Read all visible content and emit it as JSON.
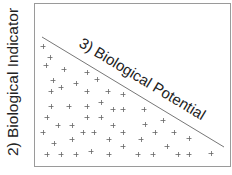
{
  "diagram": {
    "y_axis_label": "2) Biological Indicator",
    "diagonal_label": "3) Biological Potential",
    "colors": {
      "frame": "#9a9a9a",
      "line": "#777777",
      "markers": "#666666",
      "text": "#222222"
    },
    "marker_symbol": "+",
    "frame": {
      "x": 34,
      "y": 3,
      "width": 196,
      "height": 163
    },
    "diagonal": {
      "x1": 42,
      "y1": 37,
      "x2": 224,
      "y2": 147
    },
    "points": [
      [
        43,
        46
      ],
      [
        50,
        57
      ],
      [
        46,
        65
      ],
      [
        64,
        69
      ],
      [
        87,
        72
      ],
      [
        53,
        80
      ],
      [
        76,
        83
      ],
      [
        97,
        79
      ],
      [
        51,
        91
      ],
      [
        61,
        87
      ],
      [
        87,
        91
      ],
      [
        108,
        91
      ],
      [
        123,
        94
      ],
      [
        51,
        106
      ],
      [
        69,
        106
      ],
      [
        87,
        106
      ],
      [
        101,
        102
      ],
      [
        113,
        109
      ],
      [
        123,
        109
      ],
      [
        144,
        109
      ],
      [
        47,
        117
      ],
      [
        87,
        117
      ],
      [
        101,
        117
      ],
      [
        163,
        120
      ],
      [
        58,
        125
      ],
      [
        72,
        125
      ],
      [
        113,
        125
      ],
      [
        145,
        124
      ],
      [
        43,
        132
      ],
      [
        83,
        132
      ],
      [
        94,
        132
      ],
      [
        123,
        132
      ],
      [
        155,
        132
      ],
      [
        174,
        132
      ],
      [
        54,
        143
      ],
      [
        72,
        139
      ],
      [
        109,
        139
      ],
      [
        141,
        139
      ],
      [
        189,
        138
      ],
      [
        123,
        146
      ],
      [
        167,
        146
      ],
      [
        91,
        151
      ],
      [
        47,
        154
      ],
      [
        61,
        154
      ],
      [
        76,
        154
      ],
      [
        109,
        154
      ],
      [
        138,
        154
      ],
      [
        153,
        154
      ],
      [
        178,
        154
      ],
      [
        189,
        154
      ],
      [
        211,
        153
      ]
    ]
  }
}
